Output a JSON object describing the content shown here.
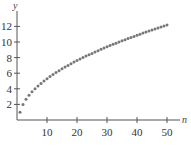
{
  "chart_data": {
    "type": "scatter",
    "title": "",
    "xlabel": "n",
    "ylabel": "y",
    "xlim": [
      0,
      55
    ],
    "ylim": [
      0,
      13.5
    ],
    "x_ticks": [
      10,
      20,
      30,
      40,
      50
    ],
    "y_ticks": [
      2,
      4,
      6,
      8,
      10,
      12
    ],
    "grid": false,
    "legend": null,
    "series": [
      {
        "name": "sequence",
        "color": "#777777",
        "x": [
          1,
          2,
          3,
          4,
          5,
          6,
          7,
          8,
          9,
          10,
          11,
          12,
          13,
          14,
          15,
          16,
          17,
          18,
          19,
          20,
          21,
          22,
          23,
          24,
          25,
          26,
          27,
          28,
          29,
          30,
          31,
          32,
          33,
          34,
          35,
          36,
          37,
          38,
          39,
          40,
          41,
          42,
          43,
          44,
          45,
          46,
          47,
          48,
          49,
          50
        ],
        "y": [
          1.0,
          2.0,
          2.65,
          3.16,
          3.61,
          4.0,
          4.36,
          4.69,
          5.0,
          5.29,
          5.57,
          5.83,
          6.08,
          6.32,
          6.56,
          6.78,
          7.0,
          7.21,
          7.42,
          7.62,
          7.81,
          8.0,
          8.19,
          8.37,
          8.54,
          8.72,
          8.89,
          9.06,
          9.22,
          9.38,
          9.54,
          9.7,
          9.85,
          10.0,
          10.15,
          10.3,
          10.44,
          10.58,
          10.72,
          10.86,
          11.0,
          11.14,
          11.27,
          11.4,
          11.53,
          11.66,
          11.79,
          11.92,
          12.04,
          12.17
        ]
      }
    ]
  }
}
